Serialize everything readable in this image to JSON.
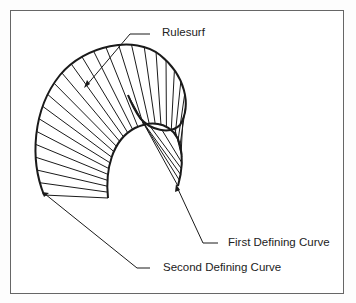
{
  "figure": {
    "labels": {
      "rulesurf": "Rulesurf",
      "first_curve": "First Defining Curve",
      "second_curve": "Second Defining Curve"
    },
    "line_color": "#1a1a1a",
    "ruling_count": 30
  }
}
